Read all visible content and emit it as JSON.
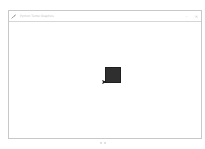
{
  "window": {
    "title": "Python Turtle Graphics",
    "icon": "feather-icon",
    "controls": [
      {
        "name": "minimize-button",
        "glyph": "–"
      },
      {
        "name": "close-button",
        "glyph": "✕"
      }
    ]
  },
  "canvas": {
    "background": "#ffffff",
    "shape": {
      "type": "filled-square",
      "fill": "#2f2f2f"
    },
    "turtle": {
      "icon": "turtle-cursor-icon",
      "color": "#1a1a1a"
    }
  },
  "colors": {
    "border": "#c8c8c8",
    "title_text": "#c0c0c0"
  }
}
